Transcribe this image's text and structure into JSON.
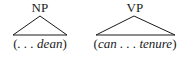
{
  "diagram": {
    "type": "syntax-tree-fragments",
    "nodes": [
      {
        "label": "NP",
        "leaf_open": "(",
        "leaf_text": ". . . dean",
        "leaf_close": ")"
      },
      {
        "label": "VP",
        "leaf_open": "(",
        "leaf_text": "can . . . tenure",
        "leaf_close": ")"
      }
    ],
    "colors": {
      "ink": "#1a1a1a",
      "background": "#ffffff"
    }
  }
}
